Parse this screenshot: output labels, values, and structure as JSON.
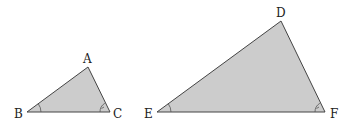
{
  "diagram": {
    "type": "similar-triangles",
    "fill_color": "#cccccc",
    "stroke_color": "#444444",
    "triangles": [
      {
        "name": "ABC",
        "vertices": {
          "A": [
            88,
            67
          ],
          "B": [
            27,
            112
          ],
          "C": [
            110,
            112
          ]
        },
        "labels": {
          "A": "A",
          "B": "B",
          "C": "C"
        },
        "angle_marks": [
          "B",
          "C"
        ]
      },
      {
        "name": "DEF",
        "vertices": {
          "D": [
            281,
            21
          ],
          "E": [
            157,
            112
          ],
          "F": [
            325,
            112
          ]
        },
        "labels": {
          "D": "D",
          "E": "E",
          "F": "F"
        },
        "angle_marks": [
          "E",
          "F"
        ]
      }
    ]
  }
}
